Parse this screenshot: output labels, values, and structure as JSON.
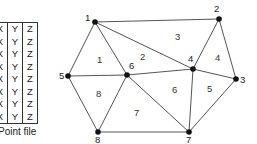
{
  "point_file": {
    "caption": "Point file",
    "columns": [
      "X",
      "Y",
      "Z"
    ],
    "rows": [
      [
        "X",
        "Y",
        "Z"
      ],
      [
        "X",
        "Y",
        "Z"
      ],
      [
        "X",
        "Y",
        "Z"
      ],
      [
        "X",
        "Y",
        "Z"
      ],
      [
        "X",
        "Y",
        "Z"
      ],
      [
        "X",
        "Y",
        "Z"
      ],
      [
        "X",
        "Y",
        "Z"
      ],
      [
        "X",
        "Y",
        "Z"
      ]
    ]
  },
  "tin": {
    "nodes": [
      {
        "id": "1",
        "x": 95,
        "y": 22,
        "lx": 85,
        "ly": 21
      },
      {
        "id": "2",
        "x": 219,
        "y": 19,
        "lx": 214,
        "ly": 12
      },
      {
        "id": "3",
        "x": 236,
        "y": 79,
        "lx": 240,
        "ly": 83
      },
      {
        "id": "4",
        "x": 193,
        "y": 69,
        "lx": 188,
        "ly": 62
      },
      {
        "id": "5",
        "x": 68,
        "y": 76,
        "lx": 59,
        "ly": 79
      },
      {
        "id": "6",
        "x": 127,
        "y": 75,
        "lx": 129,
        "ly": 69
      },
      {
        "id": "7",
        "x": 189,
        "y": 132,
        "lx": 186,
        "ly": 143
      },
      {
        "id": "8",
        "x": 98,
        "y": 132,
        "lx": 95,
        "ly": 143
      }
    ],
    "edges": [
      [
        "1",
        "2"
      ],
      [
        "1",
        "4"
      ],
      [
        "1",
        "6"
      ],
      [
        "1",
        "5"
      ],
      [
        "2",
        "4"
      ],
      [
        "2",
        "3"
      ],
      [
        "4",
        "3"
      ],
      [
        "4",
        "6"
      ],
      [
        "4",
        "7"
      ],
      [
        "3",
        "7"
      ],
      [
        "5",
        "6"
      ],
      [
        "5",
        "8"
      ],
      [
        "6",
        "8"
      ],
      [
        "6",
        "7"
      ],
      [
        "8",
        "7"
      ]
    ],
    "triangles": [
      {
        "id": "1",
        "x": 97,
        "y": 63
      },
      {
        "id": "2",
        "x": 140,
        "y": 60
      },
      {
        "id": "3",
        "x": 175,
        "y": 40
      },
      {
        "id": "4",
        "x": 215,
        "y": 61
      },
      {
        "id": "5",
        "x": 207,
        "y": 92
      },
      {
        "id": "6",
        "x": 172,
        "y": 93
      },
      {
        "id": "7",
        "x": 134,
        "y": 116
      },
      {
        "id": "8",
        "x": 96,
        "y": 97
      }
    ]
  }
}
